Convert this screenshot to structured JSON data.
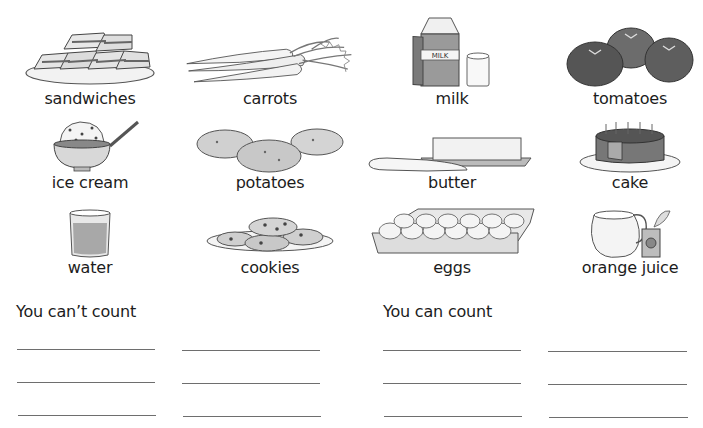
{
  "items": [
    {
      "label": "sandwiches",
      "icon": "sandwiches-icon"
    },
    {
      "label": "carrots",
      "icon": "carrots-icon"
    },
    {
      "label": "milk",
      "icon": "milk-icon",
      "carton_text": "MILK"
    },
    {
      "label": "tomatoes",
      "icon": "tomatoes-icon"
    },
    {
      "label": "ice cream",
      "icon": "ice-cream-icon"
    },
    {
      "label": "potatoes",
      "icon": "potatoes-icon"
    },
    {
      "label": "butter",
      "icon": "butter-icon"
    },
    {
      "label": "cake",
      "icon": "cake-icon"
    },
    {
      "label": "water",
      "icon": "water-icon"
    },
    {
      "label": "cookies",
      "icon": "cookies-icon"
    },
    {
      "label": "eggs",
      "icon": "eggs-icon"
    },
    {
      "label": "orange juice",
      "icon": "orange-juice-icon"
    }
  ],
  "sections": {
    "uncountable": {
      "title": "You can’t count",
      "blank_lines": 6
    },
    "countable": {
      "title": "You can count",
      "blank_lines": 6
    }
  }
}
